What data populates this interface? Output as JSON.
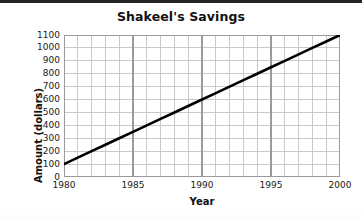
{
  "chart_data": {
    "type": "line",
    "title": "Shakeel's Savings",
    "xlabel": "Year",
    "ylabel": "Amount (dollars)",
    "xlim": [
      1980,
      2000
    ],
    "ylim": [
      0,
      1100
    ],
    "x_tick_labels": [
      "1980",
      "1985",
      "1990",
      "1995",
      "2000"
    ],
    "x_tick_values": [
      1980,
      1985,
      1990,
      1995,
      2000
    ],
    "x_minor_step": 1,
    "y_tick_labels": [
      "1100",
      "1000",
      "900",
      "800",
      "700",
      "600",
      "500",
      "400",
      "300",
      "200",
      "100",
      "0"
    ],
    "y_tick_values": [
      1100,
      1000,
      900,
      800,
      700,
      600,
      500,
      400,
      300,
      200,
      100,
      0
    ],
    "grid": true,
    "legend": false,
    "series": [
      {
        "name": "Savings",
        "color": "#000000",
        "x": [
          1980,
          1981,
          1982,
          1983,
          1984,
          1985,
          1986,
          1987,
          1988,
          1989,
          1990,
          1991,
          1992,
          1993,
          1994,
          1995,
          1996,
          1997,
          1998,
          1999,
          2000
        ],
        "values": [
          100,
          150,
          200,
          250,
          300,
          350,
          400,
          450,
          500,
          550,
          600,
          650,
          700,
          750,
          800,
          850,
          900,
          950,
          1000,
          1050,
          1100
        ]
      }
    ],
    "annotations": []
  },
  "colors": {
    "line": "#000000",
    "grid_minor": "#c9c9c9",
    "grid_major": "#9a9a9a",
    "axis_text": "#1a1a1a",
    "title_text": "#111111",
    "top_rule": "#232323",
    "background": "#ffffff"
  }
}
